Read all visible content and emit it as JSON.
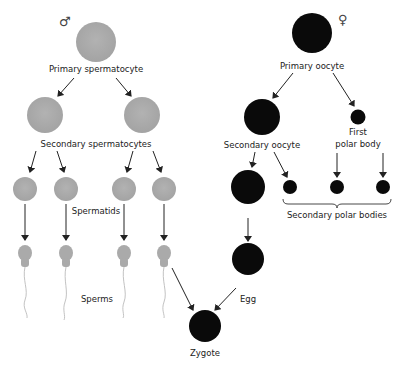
{
  "colors": {
    "male_cell": "#a9a9a9",
    "female_cell": "#0a0a0a",
    "arrow": "#222222",
    "background": "#ffffff"
  },
  "male": {
    "symbol": "♂",
    "labels": {
      "primary": "Primary spermatocyte",
      "secondary": "Secondary spermatocytes",
      "spermatids": "Spermatids",
      "sperms": "Sperms"
    }
  },
  "female": {
    "symbol": "♀",
    "labels": {
      "primary": "Primary oocyte",
      "secondary": "Secondary oocyte",
      "first_polar_1": "First",
      "first_polar_2": "polar body",
      "secondary_polar": "Secondary polar bodies",
      "egg": "Egg"
    }
  },
  "zygote": {
    "label": "Zygote"
  }
}
